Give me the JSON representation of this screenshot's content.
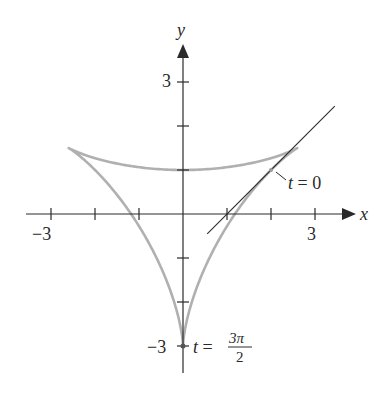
{
  "figure": {
    "type": "parametric-curve-diagram",
    "curve": {
      "x_of_t": "2cos(t) + sin(2t)",
      "y_of_t": "2sin(t) + cos(2t)",
      "t_range": [
        0,
        6.283185307
      ],
      "color": "#b0b0b0"
    },
    "tangent_line": {
      "equation": "y = x - 1",
      "at_t": 0,
      "point": [
        2,
        1
      ],
      "x_range": [
        0.55,
        3.45
      ],
      "color": "#2a2a2a"
    },
    "axes": {
      "x_label": "x",
      "y_label": "y",
      "x_range": [
        -3.6,
        3.8
      ],
      "y_range": [
        -3.6,
        3.8
      ],
      "x_ticks": [
        -3,
        -2,
        -1,
        1,
        2,
        3
      ],
      "y_ticks": [
        -3,
        -2,
        -1,
        1,
        2,
        3
      ],
      "x_tick_labels": {
        "-3": "−3",
        "3": "3"
      },
      "y_tick_labels": {
        "-3": "−3",
        "3": "3"
      }
    },
    "annotations": {
      "t0_label": "t = 0",
      "t0_var": "t",
      "t0_eq": " = 0",
      "t3pi2_var": "t",
      "t3pi2_eq": " = ",
      "t3pi2_num": "3π",
      "t3pi2_den": "2"
    },
    "pixel_mapping": {
      "origin_px": [
        183,
        214
      ],
      "unit_px": 44
    }
  }
}
